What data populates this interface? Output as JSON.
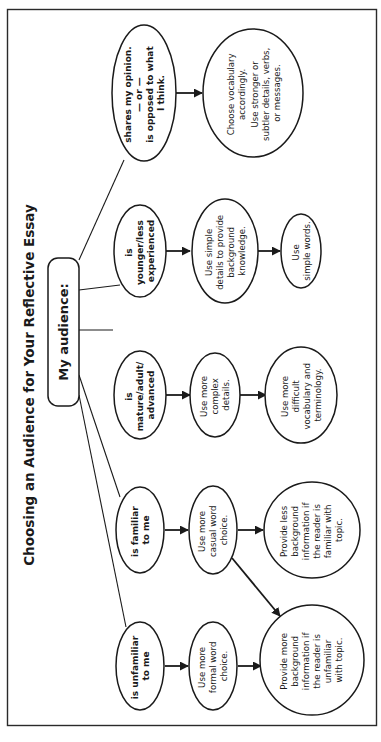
{
  "title": "Choosing an Audience for Your Reflective Essay",
  "root": {
    "label": "My audience:"
  },
  "branches": [
    {
      "condition": [
        "is unfamiliar",
        "to me"
      ],
      "step1": [
        "Use more",
        "formal word",
        "choice."
      ],
      "step2": [
        "Provide more",
        "background",
        "information if",
        "the reader is",
        "unfamiliar",
        "with topic."
      ]
    },
    {
      "condition": [
        "is familiar",
        "to me"
      ],
      "step1": [
        "Use more",
        "casual word",
        "choice."
      ],
      "step2": [
        "Provide less",
        "background",
        "information if",
        "the reader is",
        "familiar with",
        "topic."
      ]
    },
    {
      "condition": [
        "is",
        "mature/adult/",
        "advanced"
      ],
      "step1": [
        "Use more",
        "complex",
        "details."
      ],
      "step2": [
        "Use more",
        "difficult",
        "vocabulary and",
        "terminology."
      ]
    },
    {
      "condition": [
        "is",
        "younger/less",
        "experienced"
      ],
      "step1": [
        "Use simple",
        "details to provide",
        "background",
        "knowledge."
      ],
      "step2": [
        "Use",
        "simple words."
      ]
    },
    {
      "condition": [
        "shares my opinion.",
        "— or —",
        "is opposed to what",
        "I think."
      ],
      "step1": [
        "Choose vocabulary",
        "accordingly.",
        "Use stronger or",
        "subtler details, verbs,",
        "or messages."
      ]
    }
  ],
  "cross_links": [
    {
      "from": "Use more casual word choice.",
      "to": "Provide more background information if the reader is unfamiliar with topic."
    }
  ],
  "colors": {
    "ink": "#1a1a1a",
    "background": "#ffffff"
  }
}
